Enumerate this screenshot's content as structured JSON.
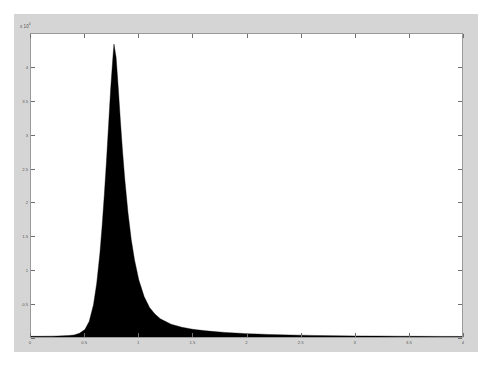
{
  "figure": {
    "background_color": "#d5d5d5",
    "axes_background_color": "#ffffff",
    "axes_border_color": "#9a9a9a",
    "data_color": "#000000"
  },
  "axis": {
    "exponent_prefix": "x 10",
    "exponent_power": "4"
  },
  "chart_data": {
    "type": "area",
    "title": "",
    "subtitle": "",
    "xlabel": "",
    "ylabel": "",
    "legend": [],
    "grid": false,
    "y_axis_multiplier": 10000,
    "y_axis_multiplier_label": "x 10^4",
    "xlim": [
      0,
      4
    ],
    "ylim": [
      0,
      4.5
    ],
    "xticks": [
      0,
      0.5,
      1,
      1.5,
      2,
      2.5,
      3,
      3.5,
      4
    ],
    "xticklabels": [
      "0",
      "0.5",
      "1",
      "1.5",
      "2",
      "2.5",
      "3",
      "3.5",
      "4"
    ],
    "yticks": [
      0,
      0.5,
      1,
      1.5,
      2,
      2.5,
      3,
      3.5,
      4
    ],
    "yticklabels": [
      "0",
      "0.5",
      "1",
      "1.5",
      "2",
      "2.5",
      "3",
      "3.5",
      "4"
    ],
    "peak_x": 0.77,
    "peak_y": 4.35,
    "x": [
      0.0,
      0.05,
      0.1,
      0.15,
      0.2,
      0.25,
      0.3,
      0.35,
      0.4,
      0.45,
      0.5,
      0.54,
      0.58,
      0.61,
      0.64,
      0.66,
      0.68,
      0.7,
      0.72,
      0.74,
      0.76,
      0.77,
      0.79,
      0.81,
      0.83,
      0.85,
      0.87,
      0.9,
      0.93,
      0.96,
      1.0,
      1.05,
      1.1,
      1.15,
      1.2,
      1.3,
      1.4,
      1.5,
      1.6,
      1.7,
      1.8,
      1.9,
      2.0,
      2.1,
      2.2,
      2.4,
      2.6,
      2.8,
      3.0,
      3.2,
      3.4,
      3.6,
      3.8,
      4.0
    ],
    "values": [
      0.01,
      0.01,
      0.011,
      0.012,
      0.013,
      0.015,
      0.018,
      0.022,
      0.03,
      0.055,
      0.11,
      0.23,
      0.48,
      0.8,
      1.25,
      1.65,
      2.1,
      2.6,
      3.15,
      3.7,
      4.15,
      4.35,
      4.15,
      3.7,
      3.2,
      2.75,
      2.35,
      1.85,
      1.45,
      1.15,
      0.85,
      0.6,
      0.44,
      0.34,
      0.27,
      0.19,
      0.145,
      0.115,
      0.095,
      0.08,
      0.068,
      0.058,
      0.05,
      0.044,
      0.038,
      0.03,
      0.024,
      0.02,
      0.016,
      0.014,
      0.012,
      0.01,
      0.009,
      0.008
    ]
  }
}
